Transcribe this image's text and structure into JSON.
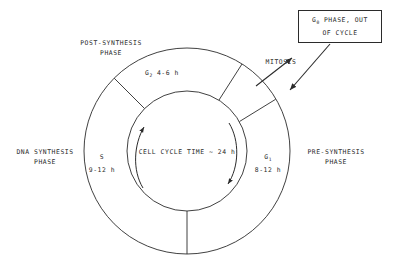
{
  "diagram": {
    "line_color": "#2b2b2b",
    "text_color": "#2b2b2b",
    "background": "#ffffff",
    "center_label": "CELL CYCLE TIME ~ 24 h",
    "g0_box": {
      "line1_prefix": "G",
      "line1_sub": "0",
      "line1_suffix": " PHASE, OUT",
      "line2": "OF CYCLE"
    },
    "mitosis_label": "MITOSIS",
    "phases": [
      {
        "key": "g2",
        "symbol_prefix": "G",
        "symbol_sub": "2",
        "duration": " 4-6 h",
        "outer_label_line1": "POST-SYNTHESIS",
        "outer_label_line2": "PHASE"
      },
      {
        "key": "s",
        "symbol_prefix": "S",
        "symbol_sub": "",
        "duration": "9-12 h",
        "outer_label_line1": "DNA SYNTHESIS",
        "outer_label_line2": "PHASE"
      },
      {
        "key": "g1",
        "symbol_prefix": "G",
        "symbol_sub": "1",
        "duration": "8-12 h",
        "outer_label_line1": "PRE-SYNTHESIS",
        "outer_label_line2": "PHASE"
      }
    ]
  }
}
